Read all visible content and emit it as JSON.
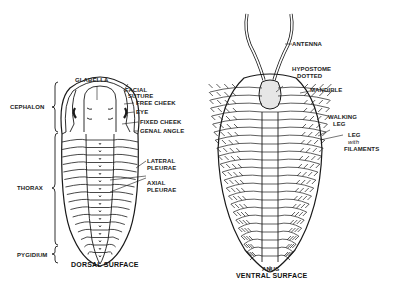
{
  "figure": {
    "dorsal": {
      "caption": "DORSAL SURFACE",
      "regions": [
        {
          "label": "CEPHALON"
        },
        {
          "label": "THORAX"
        },
        {
          "label": "PYGIDIUM"
        }
      ],
      "labels": {
        "glabella": "GLABELLA",
        "facial_suture_1": "FACIAL",
        "facial_suture_2": "SUTURE",
        "free_cheek": "FREE CHEEK",
        "eye": "EYE",
        "fixed_cheek": "FIXED CHEEK",
        "genal_angle": "GENAL ANGLE",
        "lateral_pleurae_1": "LATERAL",
        "lateral_pleurae_2": "PLEURAE",
        "axial_pleurae_1": "AXIAL",
        "axial_pleurae_2": "PLEURAE"
      }
    },
    "ventral": {
      "caption": "VENTRAL SURFACE",
      "labels": {
        "antenna": "ANTENNA",
        "hypostome_1": "HYPOSTOME",
        "hypostome_2": "DOTTED",
        "mandible": "MANDIBLE",
        "walking_leg_1": "WALKING",
        "walking_leg_2": "LEG",
        "leg_filaments_1": "LEG",
        "leg_filaments_2": "with",
        "leg_filaments_3": "FILAMENTS",
        "anus": "ANUS"
      }
    },
    "colors": {
      "ink": "#1a1a1a",
      "background": "#ffffff"
    }
  }
}
